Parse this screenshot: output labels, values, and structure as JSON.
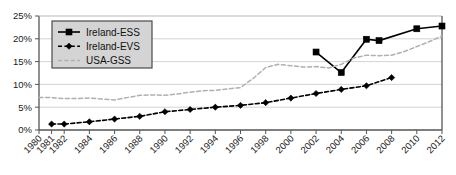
{
  "chart_data": {
    "type": "line",
    "title": "",
    "subtitle": "",
    "xlabel": "",
    "ylabel": "",
    "xlim": [
      1980,
      2012
    ],
    "ylim": [
      0,
      25
    ],
    "grid": true,
    "grid_axis": "y",
    "legend_position": "top-left",
    "x_tick_labels": [
      "1980",
      "1981",
      "1982",
      "1984",
      "1986",
      "1988",
      "1990",
      "1992",
      "1994",
      "1996",
      "1998",
      "2000",
      "2002",
      "2004",
      "2006",
      "2008",
      "2010",
      "2012"
    ],
    "x_tick_values": [
      1980,
      1981,
      1982,
      1984,
      1986,
      1988,
      1990,
      1992,
      1994,
      1996,
      1998,
      2000,
      2002,
      2004,
      2006,
      2008,
      2010,
      2012
    ],
    "y_tick_labels": [
      "0%",
      "5%",
      "10%",
      "15%",
      "20%",
      "25%"
    ],
    "y_tick_values": [
      0,
      5,
      10,
      15,
      20,
      25
    ],
    "series": [
      {
        "name": "Ireland-ESS",
        "style": "solid",
        "marker": "square",
        "color": "#000000",
        "x": [
          2002,
          2004,
          2006,
          2007,
          2010,
          2012
        ],
        "values": [
          17.1,
          12.6,
          19.9,
          19.6,
          22.2,
          22.8
        ]
      },
      {
        "name": "Ireland-EVS",
        "style": "dashed",
        "marker": "diamond",
        "color": "#000000",
        "x": [
          1981,
          1982,
          1984,
          1986,
          1988,
          1990,
          1992,
          1994,
          1996,
          1998,
          2000,
          2002,
          2004,
          2006,
          2008
        ],
        "values": [
          1.3,
          1.3,
          1.8,
          2.4,
          3.0,
          4.0,
          4.5,
          5.0,
          5.4,
          6.0,
          7.0,
          8.0,
          8.9,
          9.7,
          11.5
        ]
      },
      {
        "name": "USA-GSS",
        "style": "dashed",
        "marker": "none",
        "color": "#b0b0b0",
        "x": [
          1980,
          1981,
          1982,
          1983,
          1984,
          1985,
          1986,
          1987,
          1988,
          1989,
          1990,
          1991,
          1992,
          1993,
          1994,
          1995,
          1996,
          1997,
          1998,
          1999,
          2000,
          2001,
          2002,
          2003,
          2004,
          2005,
          2006,
          2007,
          2008,
          2009,
          2010,
          2011,
          2012
        ],
        "values": [
          7.1,
          7.1,
          6.9,
          6.9,
          7.0,
          6.8,
          6.6,
          7.1,
          7.6,
          7.7,
          7.6,
          7.9,
          8.3,
          8.6,
          8.7,
          9.0,
          9.3,
          11.3,
          13.7,
          14.4,
          14.1,
          13.8,
          13.9,
          13.6,
          14.4,
          15.8,
          16.4,
          16.3,
          16.4,
          17.2,
          18.3,
          19.4,
          20.6
        ]
      }
    ]
  },
  "legend": {
    "items": [
      {
        "label": "Ireland-ESS"
      },
      {
        "label": "Ireland-EVS"
      },
      {
        "label": "USA-GSS"
      }
    ]
  },
  "colors": {
    "axis": "#555555",
    "grid": "#c8c8c8",
    "ess": "#000000",
    "evs": "#000000",
    "gss": "#b0b0b0",
    "legend_background": "#d4d4d4",
    "legend_border": "#4a4a4a",
    "plot_background": "#ffffff"
  }
}
